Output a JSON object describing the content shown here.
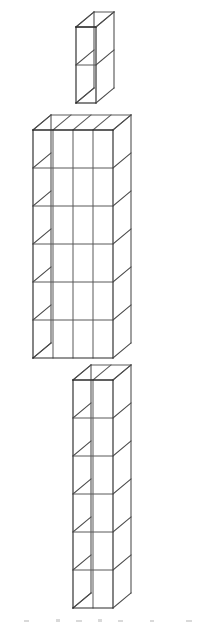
{
  "image": {
    "title": "Isometric unit-cube figure",
    "description": "Wireframe drawing of a humanoid shape built from unit cubes",
    "background_color": "#ffffff",
    "width": 208,
    "height": 625
  },
  "render": {
    "cube_width": 20,
    "cube_height": 38,
    "depth_dx": 18,
    "depth_dy": -15,
    "stroke_front": "#2b2b2b",
    "stroke_top": "#5d5d5d",
    "stroke_side": "#4a4a4a",
    "stroke_inner": "#585858",
    "face_fill": "#ffffff"
  },
  "figure": {
    "parts": [
      {
        "name": "head",
        "origin_x": 76,
        "origin_y": 103,
        "columns": 1,
        "rows": 2,
        "cube_count": 2
      },
      {
        "name": "torso",
        "origin_x": 33,
        "origin_y": 358,
        "columns": 4,
        "rows": 6,
        "cube_count": 24
      },
      {
        "name": "legs",
        "origin_x": 73,
        "origin_y": 608,
        "columns": 2,
        "rows": 6,
        "cube_count": 12
      }
    ],
    "total_cube_count": 38
  },
  "artifacts": {
    "baseline_marks_color": "#d9d9d9",
    "baseline_marks": [
      {
        "x": 24,
        "y": 620,
        "w": 5,
        "h": 2
      },
      {
        "x": 56,
        "y": 619,
        "w": 4,
        "h": 3
      },
      {
        "x": 76,
        "y": 620,
        "w": 6,
        "h": 2
      },
      {
        "x": 98,
        "y": 619,
        "w": 4,
        "h": 3
      },
      {
        "x": 118,
        "y": 620,
        "w": 5,
        "h": 2
      },
      {
        "x": 150,
        "y": 620,
        "w": 4,
        "h": 2
      },
      {
        "x": 186,
        "y": 620,
        "w": 6,
        "h": 2
      }
    ]
  }
}
